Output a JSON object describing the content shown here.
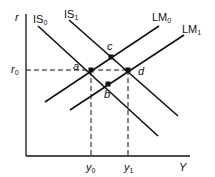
{
  "diagram": {
    "type": "IS-LM",
    "axes": {
      "y_label": "r",
      "x_label": "Y"
    },
    "ticks": {
      "r0": {
        "base": "r",
        "sub": "0"
      },
      "y0": {
        "base": "y",
        "sub": "0"
      },
      "y1": {
        "base": "y",
        "sub": "1"
      }
    },
    "curves": {
      "IS0": {
        "base": "IS",
        "sub": "0"
      },
      "IS1": {
        "base": "IS",
        "sub": "1"
      },
      "LM0": {
        "base": "LM",
        "sub": "0"
      },
      "LM1": {
        "base": "LM",
        "sub": "1"
      }
    },
    "points": {
      "a": "a",
      "b": "b",
      "c": "c",
      "d": "d"
    },
    "colors": {
      "line": "#111111",
      "background": "#ffffff"
    }
  }
}
